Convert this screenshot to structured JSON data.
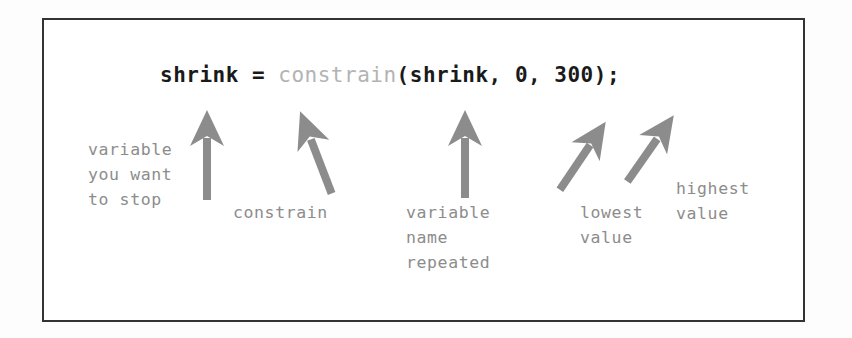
{
  "figure": {
    "kind": "annotated-code-diagram",
    "border_color": "#333333",
    "background_color": "#ffffff",
    "ink_color": "#1a1a1a",
    "annotation_color": "#8c8c8c",
    "dim_token_color": "#b3b3b3",
    "arrow_color": "#8c8c8c"
  },
  "code": {
    "full_text": "shrink = constrain(shrink, 0, 300);",
    "tokens": [
      {
        "text": "shrink = ",
        "style": "strong"
      },
      {
        "text": "constrain",
        "style": "dim"
      },
      {
        "text": "(shrink, 0, 300);",
        "style": "strong"
      }
    ]
  },
  "annotations": [
    {
      "id": "variable-you-want-to-stop",
      "text": "variable\nyou want\nto stop",
      "lines": [
        "variable",
        "you want",
        "to stop"
      ],
      "points_to": "shrink"
    },
    {
      "id": "constrain",
      "text": "constrain",
      "lines": [
        "constrain"
      ],
      "points_to": "constrain"
    },
    {
      "id": "variable-name-repeated",
      "text": "variable\nname\nrepeated",
      "lines": [
        "variable",
        "name",
        "repeated"
      ],
      "points_to": "shrink"
    },
    {
      "id": "lowest-value",
      "text": "lowest\nvalue",
      "lines": [
        "lowest",
        "value"
      ],
      "points_to": "0"
    },
    {
      "id": "highest-value",
      "text": "highest\nvalue",
      "lines": [
        "highest",
        "value"
      ],
      "points_to": "300"
    }
  ]
}
